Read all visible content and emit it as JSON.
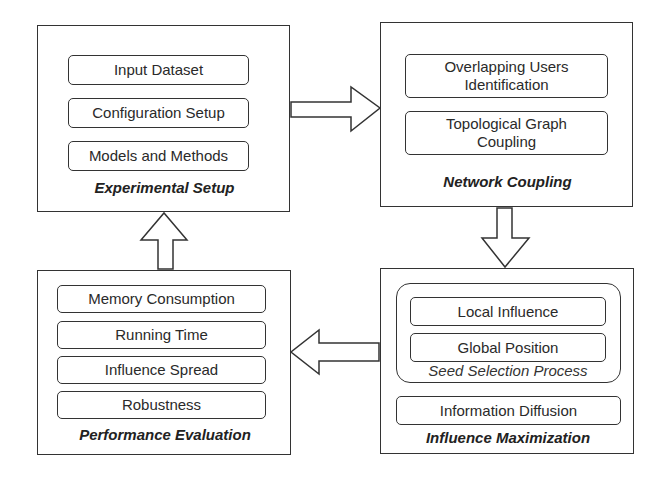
{
  "diagram": {
    "panels": [
      {
        "id": "experimental-setup",
        "caption": "Experimental Setup",
        "items": [
          "Input Dataset",
          "Configuration Setup",
          "Models and Methods"
        ]
      },
      {
        "id": "network-coupling",
        "caption": "Network Coupling",
        "items": [
          "Overlapping Users\nIdentification",
          "Topological Graph\nCoupling"
        ]
      },
      {
        "id": "influence-maximization",
        "caption": "Influence Maximization",
        "group": {
          "caption": "Seed Selection Process",
          "items": [
            "Local Influence",
            "Global Position"
          ]
        },
        "items": [
          "Information Diffusion"
        ]
      },
      {
        "id": "performance-evaluation",
        "caption": "Performance Evaluation",
        "items": [
          "Memory Consumption",
          "Running Time",
          "Influence Spread",
          "Robustness"
        ]
      }
    ],
    "arrows": [
      {
        "from": "Experimental Setup",
        "to": "Network Coupling",
        "direction": "right"
      },
      {
        "from": "Network Coupling",
        "to": "Influence Maximization",
        "direction": "down"
      },
      {
        "from": "Influence Maximization",
        "to": "Performance Evaluation",
        "direction": "left"
      },
      {
        "from": "Performance Evaluation",
        "to": "Experimental Setup",
        "direction": "up"
      }
    ]
  }
}
